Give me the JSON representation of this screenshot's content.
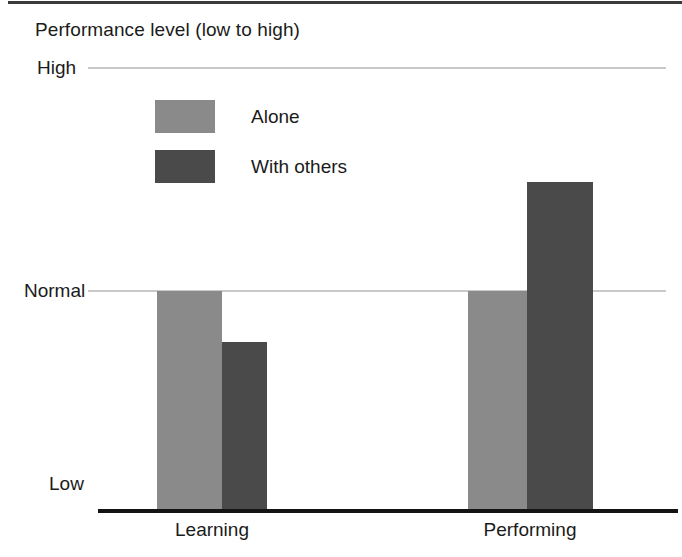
{
  "figure": {
    "title": "Performance level (low to high)"
  },
  "chart_data": {
    "type": "bar",
    "title": "Performance level (low to high)",
    "xlabel": "",
    "ylabel": "Performance level (low to high)",
    "categories": [
      "Learning",
      "Performing"
    ],
    "series": [
      {
        "name": "Alone",
        "color": "#8a8a8a",
        "values": [
          1.0,
          1.0
        ]
      },
      {
        "name": "With others",
        "color": "#4a4a4a",
        "values": [
          0.77,
          1.49
        ]
      }
    ],
    "y_tick_labels": [
      "Low",
      "Normal",
      "High"
    ],
    "y_tick_values": [
      0,
      1,
      2
    ],
    "ylim": [
      0,
      2
    ],
    "grid": true,
    "gridline_labels": [
      "High",
      "Normal"
    ],
    "legend_position": "upper-left-inside",
    "annotation": "Bars are plotted on an unnumbered ordinal scale: Low at the baseline, Normal at the middle gridline, High at the top gridline."
  },
  "axes": {
    "y_ticks": {
      "high": "High",
      "normal": "Normal",
      "low": "Low"
    },
    "x_ticks": {
      "learning": "Learning",
      "performing": "Performing"
    }
  },
  "legend": {
    "items": [
      {
        "label": "Alone",
        "color": "#8a8a8a"
      },
      {
        "label": "With others",
        "color": "#4a4a4a"
      }
    ]
  },
  "colors": {
    "alone": "#8a8a8a",
    "with_others": "#4a4a4a",
    "gridline": "#c9c9c9",
    "axis": "#131313",
    "text": "#1b1b1b",
    "background": "#ffffff"
  }
}
